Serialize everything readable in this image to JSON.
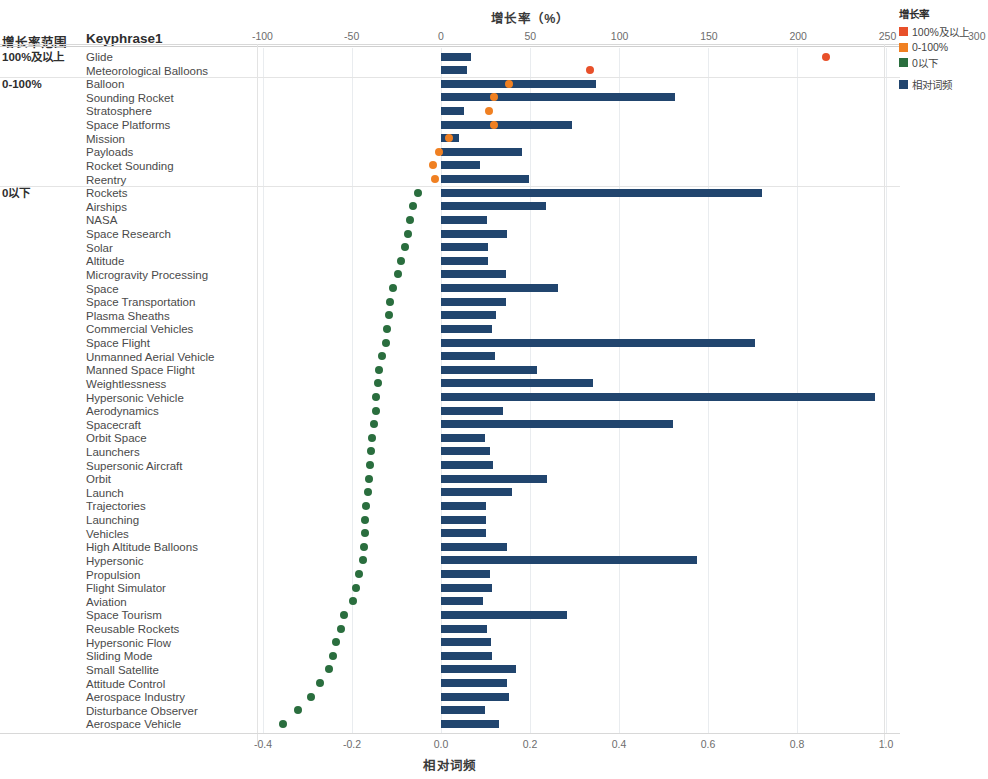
{
  "header": {
    "group_col_label": "增长率范围",
    "keyphrase_col_label": "Keyphrase1"
  },
  "top_axis": {
    "title": "增长率（%）",
    "ticks": [
      -100,
      -50,
      0,
      50,
      100,
      150,
      200,
      250,
      300
    ],
    "tick_labels": [
      "-100",
      "-50",
      "0",
      "50",
      "100",
      "150",
      "200",
      "250",
      "300"
    ],
    "min": -100,
    "max": 300
  },
  "bottom_axis": {
    "title": "相对词频",
    "ticks": [
      -0.4,
      -0.2,
      0.0,
      0.2,
      0.4,
      0.6,
      0.8,
      1.0
    ],
    "tick_labels": [
      "-0.4",
      "-0.2",
      "0.0",
      "0.2",
      "0.4",
      "0.6",
      "0.8",
      "1.0"
    ],
    "min": -0.45,
    "max": 1.0
  },
  "legend": {
    "title": "增长率",
    "items": [
      {
        "label": "100%及以上",
        "color": "#e8502a",
        "icon": "square-swatch"
      },
      {
        "label": "0-100%",
        "color": "#f08022",
        "icon": "square-swatch"
      },
      {
        "label": "0以下",
        "color": "#2a6e3e",
        "icon": "square-swatch"
      }
    ],
    "series_items": [
      {
        "label": "相对词频",
        "color": "#21456e",
        "icon": "square-swatch"
      }
    ]
  },
  "colors": {
    "bar": "#21456e",
    "dot_above_100": "#e8502a",
    "dot_0_100": "#f08022",
    "dot_below_0": "#2a6e3e",
    "grid": "#e9ecef",
    "separator": "#dcdcdc"
  },
  "groups": [
    {
      "label": "100%及以上",
      "start_index": 0,
      "count": 2
    },
    {
      "label": "0-100%",
      "start_index": 2,
      "count": 8
    },
    {
      "label": "0以下",
      "start_index": 10,
      "count": 39
    }
  ],
  "chart_data": {
    "type": "bar",
    "title": "",
    "xlabel": "相对词频",
    "ylabel": "Keyphrase1",
    "secondary_xlabel": "增长率（%）",
    "xlim": [
      -0.45,
      1.0
    ],
    "secondary_xlim": [
      -100,
      300
    ],
    "grid": true,
    "legend_position": "right",
    "categories": [
      "Glide",
      "Meteorological Balloons",
      "Balloon",
      "Sounding Rocket",
      "Stratosphere",
      "Space Platforms",
      "Mission",
      "Payloads",
      "Rocket Sounding",
      "Reentry",
      "Rockets",
      "Airships",
      "NASA",
      "Space Research",
      "Solar",
      "Altitude",
      "Microgravity Processing",
      "Space",
      "Space Transportation",
      "Plasma Sheaths",
      "Commercial Vehicles",
      "Space Flight",
      "Unmanned Aerial Vehicle",
      "Manned Space Flight",
      "Weightlessness",
      "Hypersonic Vehicle",
      "Aerodynamics",
      "Spacecraft",
      "Orbit Space",
      "Launchers",
      "Supersonic Aircraft",
      "Orbit",
      "Launch",
      "Trajectories",
      "Launching",
      "Vehicles",
      "High Altitude Balloons",
      "Hypersonic",
      "Propulsion",
      "Flight Simulator",
      "Aviation",
      "Space Tourism",
      "Reusable Rockets",
      "Hypersonic Flow",
      "Sliding Mode",
      "Small Satellite",
      "Attitude Control",
      "Aerospace Industry",
      "Disturbance Observer",
      "Aerospace Vehicle"
    ],
    "series": [
      {
        "name": "相对词频",
        "type": "bar",
        "color": "#21456e",
        "values": [
          0.067,
          0.059,
          0.349,
          0.525,
          0.052,
          0.295,
          0.041,
          0.183,
          0.087,
          0.197,
          0.722,
          0.236,
          0.104,
          0.148,
          0.105,
          0.105,
          0.147,
          0.263,
          0.147,
          0.123,
          0.115,
          0.705,
          0.121,
          0.216,
          0.341,
          0.975,
          0.139,
          0.521,
          0.099,
          0.111,
          0.116,
          0.239,
          0.159,
          0.102,
          0.101,
          0.101,
          0.148,
          0.575,
          0.109,
          0.114,
          0.095,
          0.283,
          0.104,
          0.113,
          0.114,
          0.169,
          0.148,
          0.152,
          0.099,
          0.131
        ]
      },
      {
        "name": "增长率",
        "type": "scatter",
        "values": [
          250.0,
          98.5,
          34.0,
          25.5,
          23.0,
          25.5,
          3.5,
          -1.0,
          -3.5,
          -3.0,
          -11.5,
          -14.0,
          -15.5,
          -16.5,
          -18.0,
          -20.0,
          -21.5,
          -24.0,
          -25.5,
          -26.0,
          -27.0,
          -27.5,
          -29.5,
          -96.0,
          -97.0,
          -98.0,
          -99.0,
          -100.0,
          -103.0,
          -105.0,
          -107.0,
          -108.0,
          -110.0,
          -112.0,
          -113.0,
          -114.0,
          -116.0,
          -118.0,
          -125.0,
          -130.0,
          -133.0,
          -148.0,
          -152.0,
          -160.0,
          -165.0,
          -172.0,
          -185.0,
          -200.0,
          -222.0,
          -250.0
        ],
        "point_colors": [
          "#e8502a",
          "#e8502a",
          "#f08022",
          "#f08022",
          "#f08022",
          "#f08022",
          "#f08022",
          "#f08022",
          "#f08022",
          "#f08022",
          "#2a6e3e",
          "#2a6e3e",
          "#2a6e3e",
          "#2a6e3e",
          "#2a6e3e",
          "#2a6e3e",
          "#2a6e3e",
          "#2a6e3e",
          "#2a6e3e",
          "#2a6e3e",
          "#2a6e3e",
          "#2a6e3e",
          "#2a6e3e",
          "#2a6e3e",
          "#2a6e3e",
          "#2a6e3e",
          "#2a6e3e",
          "#2a6e3e",
          "#2a6e3e",
          "#2a6e3e",
          "#2a6e3e",
          "#2a6e3e",
          "#2a6e3e",
          "#2a6e3e",
          "#2a6e3e",
          "#2a6e3e",
          "#2a6e3e",
          "#2a6e3e",
          "#2a6e3e",
          "#2a6e3e",
          "#2a6e3e",
          "#2a6e3e",
          "#2a6e3e",
          "#2a6e3e",
          "#2a6e3e",
          "#2a6e3e",
          "#2a6e3e",
          "#2a6e3e",
          "#2a6e3e",
          "#2a6e3e"
        ],
        "dot_x_rel_freq_scale": [
          0.865,
          0.335,
          0.152,
          0.118,
          0.108,
          0.118,
          0.018,
          -0.005,
          -0.017,
          -0.014,
          -0.052,
          -0.063,
          -0.07,
          -0.074,
          -0.081,
          -0.089,
          -0.097,
          -0.107,
          -0.114,
          -0.116,
          -0.121,
          -0.123,
          -0.132,
          -0.14,
          -0.142,
          -0.145,
          -0.147,
          -0.15,
          -0.154,
          -0.157,
          -0.16,
          -0.162,
          -0.165,
          -0.168,
          -0.17,
          -0.171,
          -0.173,
          -0.176,
          -0.185,
          -0.192,
          -0.197,
          -0.218,
          -0.224,
          -0.235,
          -0.242,
          -0.252,
          -0.271,
          -0.292,
          -0.322,
          -0.355
        ]
      }
    ]
  }
}
